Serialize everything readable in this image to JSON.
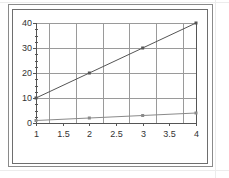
{
  "chart_data": {
    "type": "line",
    "title": "",
    "xlabel": "",
    "ylabel": "",
    "x": [
      1,
      2,
      3,
      4
    ],
    "series": [
      {
        "name": "Series 1",
        "values": [
          10,
          20,
          30,
          40
        ],
        "color": "#555555",
        "marker": "square"
      },
      {
        "name": "Series 2",
        "values": [
          1,
          2,
          3,
          4
        ],
        "color": "#8a8a8a",
        "marker": "square"
      }
    ],
    "xlim": [
      1,
      4
    ],
    "ylim": [
      0,
      40
    ],
    "x_ticks": [
      1,
      1.5,
      2,
      2.5,
      3,
      3.5,
      4
    ],
    "y_ticks": [
      0,
      10,
      20,
      30,
      40
    ],
    "x_gridlines": [
      1.25,
      1.75,
      2.25,
      2.75,
      3.25,
      3.75
    ],
    "y_gridlines": [
      10,
      20,
      30,
      40
    ],
    "grid": true,
    "legend": "none"
  },
  "colors": {
    "frame": "#6e6e6e",
    "grid": "#9a9a9a",
    "axis": "#555555",
    "text": "#333333"
  }
}
